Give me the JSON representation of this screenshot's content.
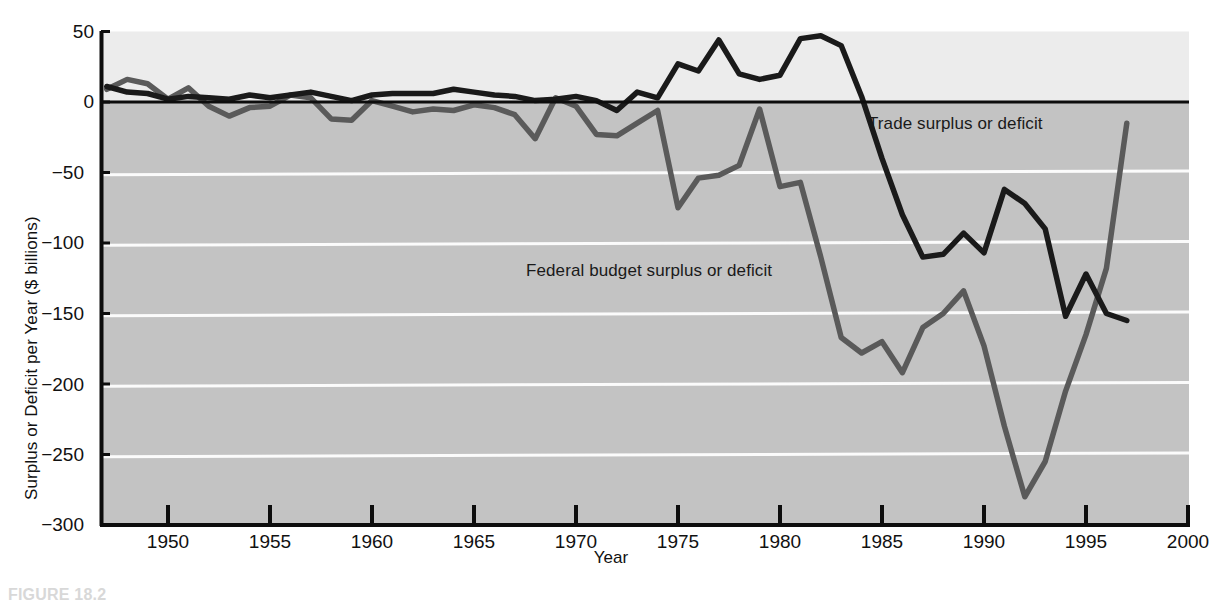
{
  "figure": {
    "caption": "FIGURE 18.2"
  },
  "chart_data": {
    "type": "line",
    "title": "",
    "xlabel": "Year",
    "ylabel": "Surplus or Deficit per Year ($ billions)",
    "xlim": [
      1947,
      2000
    ],
    "ylim": [
      -300,
      50
    ],
    "grid": "horizontal-white-gridlines",
    "legend_position": "inline-annotations",
    "xticks": [
      1950,
      1955,
      1960,
      1965,
      1970,
      1975,
      1980,
      1985,
      1990,
      1995,
      2000
    ],
    "xtick_labels": [
      "1950",
      "1955",
      "1960",
      "1965",
      "1970",
      "1975",
      "1980",
      "1985",
      "1990",
      "1995",
      "2000"
    ],
    "yticks": [
      50,
      0,
      -50,
      -100,
      -150,
      -200,
      -250,
      -300
    ],
    "ytick_labels": [
      "50",
      "0",
      "−50",
      "−100",
      "−150",
      "−200",
      "−250",
      "−300"
    ],
    "x": [
      1947,
      1948,
      1949,
      1950,
      1951,
      1952,
      1953,
      1954,
      1955,
      1956,
      1957,
      1958,
      1959,
      1960,
      1961,
      1962,
      1963,
      1964,
      1965,
      1966,
      1967,
      1968,
      1969,
      1970,
      1971,
      1972,
      1973,
      1974,
      1975,
      1976,
      1977,
      1978,
      1979,
      1980,
      1981,
      1982,
      1983,
      1984,
      1985,
      1986,
      1987,
      1988,
      1989,
      1990,
      1991,
      1992,
      1993,
      1994,
      1995,
      1996,
      1997
    ],
    "series": [
      {
        "name": "Federal budget surplus or deficit",
        "color": "#5a5a5a",
        "values": [
          9,
          16,
          13,
          2,
          10,
          -3,
          -10,
          -4,
          -3,
          5,
          3,
          -12,
          -13,
          1,
          -3,
          -7,
          -5,
          -6,
          -2,
          -4,
          -9,
          -26,
          3,
          -3,
          -23,
          -24,
          -15,
          -6,
          -75,
          -54,
          -52,
          -45,
          -5,
          -60,
          -57,
          -110,
          -167,
          -178,
          -170,
          -192,
          -160,
          -150,
          -134,
          -173,
          -230,
          -280,
          -255,
          -205,
          -165,
          -118,
          -15
        ]
      },
      {
        "name": "Trade surplus or deficit",
        "color": "#1a1a1a",
        "values": [
          11,
          7,
          6,
          2,
          4,
          3,
          2,
          5,
          3,
          5,
          7,
          4,
          1,
          5,
          6,
          6,
          6,
          9,
          7,
          5,
          4,
          1,
          2,
          4,
          1,
          -6,
          7,
          3,
          27,
          22,
          44,
          20,
          16,
          19,
          45,
          47,
          40,
          4,
          -40,
          -80,
          -110,
          -108,
          -93,
          -107,
          -62,
          -72,
          -90,
          -152,
          -122,
          -150,
          -155
        ]
      }
    ],
    "annotations": [
      {
        "text": "Trade surplus or deficit",
        "series": "Trade surplus or deficit",
        "x_px": 868,
        "y_px": 114
      },
      {
        "text": "Federal budget surplus or deficit",
        "series": "Federal budget surplus or deficit",
        "x_px": 526,
        "y_px": 261
      }
    ],
    "colors": {
      "plot_background_negative": "#c3c3c3",
      "plot_background_positive": "#ececec",
      "gridline": "#fbfbfb",
      "axis": "#0d0d0d",
      "trade_line": "#1a1a1a",
      "budget_line": "#5a5a5a"
    }
  }
}
